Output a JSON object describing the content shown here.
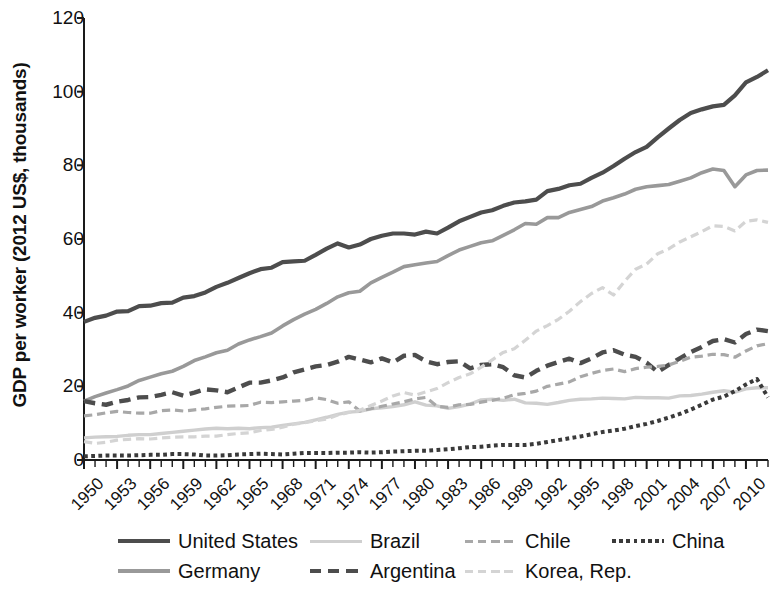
{
  "chart_data": {
    "type": "line",
    "title": "",
    "subtitle": "",
    "xlabel": "",
    "ylabel": "GDP per worker (2012 US$, thousands)",
    "xlim": [
      1950,
      2012
    ],
    "ylim": [
      0,
      120
    ],
    "ytick_values": [
      0,
      20,
      40,
      60,
      80,
      100,
      120
    ],
    "ytick_labels": [
      "0",
      "20",
      "40",
      "60",
      "80",
      "100",
      "120"
    ],
    "xtick_labels": [
      "1950",
      "1953",
      "1956",
      "1959",
      "1962",
      "1965",
      "1968",
      "1971",
      "1974",
      "1977",
      "1980",
      "1983",
      "1986",
      "1989",
      "1992",
      "1995",
      "1998",
      "2001",
      "2004",
      "2007",
      "2010"
    ],
    "xtick_values": [
      1950,
      1953,
      1956,
      1959,
      1962,
      1965,
      1968,
      1971,
      1974,
      1977,
      1980,
      1983,
      1986,
      1989,
      1992,
      1995,
      1998,
      2001,
      2004,
      2007,
      2010
    ],
    "minor_tick_step": 1,
    "grid": false,
    "legend_position": "bottom",
    "x": [
      1950,
      1951,
      1952,
      1953,
      1954,
      1955,
      1956,
      1957,
      1958,
      1959,
      1960,
      1961,
      1962,
      1963,
      1964,
      1965,
      1966,
      1967,
      1968,
      1969,
      1970,
      1971,
      1972,
      1973,
      1974,
      1975,
      1976,
      1977,
      1978,
      1979,
      1980,
      1981,
      1982,
      1983,
      1984,
      1985,
      1986,
      1987,
      1988,
      1989,
      1990,
      1991,
      1992,
      1993,
      1994,
      1995,
      1996,
      1997,
      1998,
      1999,
      2000,
      2001,
      2002,
      2003,
      2004,
      2005,
      2006,
      2007,
      2008,
      2009,
      2010,
      2011,
      2012
    ],
    "series": [
      {
        "name": "United States",
        "color": "#4d4d4d",
        "style": "solid",
        "width": 4.2,
        "values": [
          37.5,
          38.6,
          39.2,
          40.3,
          40.4,
          41.8,
          41.9,
          42.6,
          42.7,
          44.1,
          44.5,
          45.5,
          47.0,
          48.1,
          49.4,
          50.7,
          51.8,
          52.2,
          53.7,
          53.9,
          54.1,
          55.7,
          57.4,
          58.8,
          57.7,
          58.5,
          60.0,
          60.9,
          61.5,
          61.5,
          61.2,
          62.0,
          61.5,
          63.1,
          64.8,
          66.0,
          67.2,
          67.8,
          69.0,
          69.9,
          70.2,
          70.7,
          73.0,
          73.6,
          74.6,
          75.0,
          76.6,
          78.0,
          79.8,
          81.8,
          83.6,
          85.0,
          87.6,
          90.0,
          92.3,
          94.2,
          95.2,
          96.0,
          96.4,
          99.0,
          102.5,
          104.0,
          105.8
        ]
      },
      {
        "name": "Germany",
        "color": "#999999",
        "style": "solid",
        "width": 3.6,
        "values": [
          16.0,
          17.2,
          18.2,
          19.1,
          20.1,
          21.6,
          22.5,
          23.4,
          24.1,
          25.4,
          27.0,
          28.0,
          29.1,
          29.8,
          31.5,
          32.6,
          33.5,
          34.5,
          36.4,
          38.1,
          39.6,
          40.9,
          42.5,
          44.3,
          45.4,
          45.8,
          48.1,
          49.6,
          51.0,
          52.5,
          53.0,
          53.5,
          53.9,
          55.5,
          57.0,
          58.0,
          59.0,
          59.5,
          61.0,
          62.5,
          64.2,
          64.0,
          65.8,
          65.8,
          67.2,
          68.0,
          68.8,
          70.3,
          71.2,
          72.2,
          73.5,
          74.2,
          74.5,
          74.8,
          75.7,
          76.6,
          78.0,
          79.0,
          78.6,
          74.2,
          77.4,
          78.6,
          78.7
        ]
      },
      {
        "name": "Brazil",
        "color": "#cfcfcf",
        "style": "solid",
        "width": 3.4,
        "values": [
          6.0,
          6.2,
          6.3,
          6.4,
          6.7,
          6.9,
          6.9,
          7.2,
          7.5,
          7.8,
          8.1,
          8.4,
          8.6,
          8.5,
          8.6,
          8.5,
          8.8,
          8.9,
          9.4,
          9.8,
          10.2,
          10.9,
          11.6,
          12.4,
          13.0,
          13.2,
          13.9,
          14.2,
          14.5,
          15.0,
          15.8,
          14.9,
          14.7,
          14.0,
          14.5,
          15.2,
          16.3,
          16.5,
          16.2,
          16.5,
          15.5,
          15.4,
          15.1,
          15.6,
          16.2,
          16.5,
          16.6,
          16.8,
          16.7,
          16.6,
          17.0,
          16.9,
          16.9,
          16.8,
          17.4,
          17.5,
          17.9,
          18.4,
          18.8,
          18.4,
          19.3,
          19.6,
          19.6
        ]
      },
      {
        "name": "Argentina",
        "color": "#4d4d4d",
        "style": "dashed",
        "width": 4.4,
        "values": [
          16.0,
          15.4,
          15.0,
          15.8,
          16.3,
          17.0,
          17.1,
          17.7,
          18.4,
          17.5,
          18.3,
          19.2,
          18.9,
          18.4,
          19.7,
          21.0,
          21.0,
          21.6,
          22.4,
          23.8,
          24.6,
          25.4,
          25.8,
          26.7,
          28.0,
          27.3,
          26.5,
          27.6,
          26.5,
          28.3,
          28.5,
          26.8,
          26.0,
          26.6,
          26.8,
          24.9,
          25.8,
          26.0,
          25.2,
          23.0,
          22.4,
          24.2,
          25.6,
          26.6,
          27.5,
          26.3,
          27.6,
          29.2,
          29.8,
          28.6,
          28.0,
          26.4,
          23.9,
          25.8,
          27.6,
          29.3,
          30.7,
          32.3,
          32.8,
          31.9,
          34.2,
          35.4,
          35.0
        ]
      },
      {
        "name": "Chile",
        "color": "#a8a8a8",
        "style": "dashed",
        "width": 3.2,
        "values": [
          12.0,
          12.3,
          12.8,
          13.2,
          12.9,
          12.7,
          12.7,
          13.4,
          13.6,
          13.3,
          13.6,
          13.9,
          14.3,
          14.6,
          14.7,
          14.8,
          15.7,
          15.6,
          15.8,
          16.0,
          16.2,
          16.9,
          16.4,
          15.4,
          15.8,
          13.3,
          13.9,
          14.6,
          15.2,
          15.8,
          16.6,
          17.0,
          14.6,
          14.3,
          15.0,
          15.1,
          15.7,
          16.2,
          16.8,
          17.7,
          18.1,
          18.7,
          20.0,
          20.6,
          21.2,
          22.6,
          23.5,
          24.3,
          24.7,
          24.0,
          24.8,
          25.2,
          25.4,
          25.8,
          26.8,
          27.9,
          28.2,
          28.7,
          28.6,
          27.9,
          29.6,
          31.0,
          31.6
        ]
      },
      {
        "name": "Korea, Rep.",
        "color": "#d4d4d4",
        "style": "dashed",
        "width": 3.2,
        "values": [
          5.0,
          4.5,
          4.8,
          5.4,
          5.6,
          5.8,
          5.7,
          6.0,
          6.2,
          6.3,
          6.3,
          6.5,
          6.5,
          6.9,
          7.2,
          7.4,
          8.0,
          8.3,
          8.9,
          9.7,
          10.1,
          10.7,
          11.1,
          12.2,
          12.9,
          13.5,
          14.8,
          16.0,
          17.4,
          18.3,
          17.6,
          18.5,
          19.4,
          21.0,
          22.4,
          23.4,
          25.2,
          27.2,
          29.2,
          30.2,
          32.5,
          35.0,
          36.5,
          38.2,
          40.4,
          43.0,
          45.2,
          46.8,
          44.8,
          48.5,
          51.8,
          53.2,
          56.0,
          57.3,
          59.2,
          60.6,
          62.0,
          63.6,
          63.4,
          62.2,
          64.8,
          65.2,
          64.5
        ]
      },
      {
        "name": "China",
        "color": "#3a3a3a",
        "style": "dotted",
        "width": 4.0,
        "values": [
          1.0,
          1.1,
          1.2,
          1.2,
          1.2,
          1.3,
          1.4,
          1.4,
          1.6,
          1.6,
          1.5,
          1.2,
          1.2,
          1.3,
          1.5,
          1.6,
          1.7,
          1.6,
          1.5,
          1.7,
          1.9,
          1.9,
          1.9,
          2.0,
          2.0,
          2.1,
          2.0,
          2.1,
          2.3,
          2.4,
          2.5,
          2.5,
          2.7,
          2.9,
          3.2,
          3.5,
          3.6,
          3.9,
          4.1,
          4.1,
          4.1,
          4.4,
          4.9,
          5.4,
          5.9,
          6.4,
          7.0,
          7.6,
          8.0,
          8.5,
          9.2,
          9.8,
          10.6,
          11.5,
          12.5,
          13.7,
          15.0,
          16.4,
          17.2,
          18.7,
          20.5,
          22.0,
          17.0
        ]
      }
    ]
  },
  "legend": {
    "row1": [
      {
        "label": "United States",
        "series": "United States"
      },
      {
        "label": "Brazil",
        "series": "Brazil"
      },
      {
        "label": "Chile",
        "series": "Chile"
      },
      {
        "label": "China",
        "series": "China"
      }
    ],
    "row2": [
      {
        "label": "Germany",
        "series": "Germany"
      },
      {
        "label": "Argentina",
        "series": "Argentina"
      },
      {
        "label": "Korea, Rep.",
        "series": "Korea, Rep."
      }
    ]
  }
}
